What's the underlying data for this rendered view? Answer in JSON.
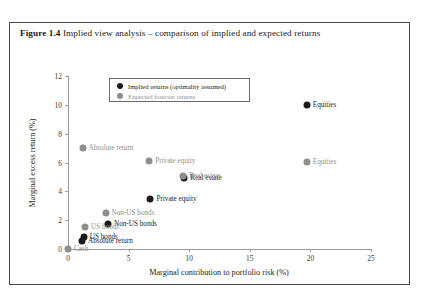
{
  "figure": {
    "number": "Figure 1.4",
    "caption": "Implied view analysis – comparison of implied and expected returns"
  },
  "legend": {
    "items": [
      {
        "label": "Implied returns (optimality assumed)",
        "series": "implied",
        "color": "#1a1a1a"
      },
      {
        "label": "Expected forecast returns",
        "series": "expected",
        "color": "#8e8e8e"
      }
    ]
  },
  "chart_data": {
    "type": "scatter",
    "title": "Implied view analysis – comparison of implied and expected returns",
    "xlabel": "Marginal contribution to portfolio risk (%)",
    "ylabel": "Marginal excess return (%)",
    "xlim": [
      0,
      25
    ],
    "ylim": [
      0,
      12
    ],
    "xticks": [
      0,
      5,
      10,
      15,
      20,
      25
    ],
    "yticks": [
      0,
      2,
      4,
      6,
      8,
      10,
      12
    ],
    "grid": false,
    "legend_position": "upper-center",
    "series": [
      {
        "name": "Implied returns (optimality assumed)",
        "color": "#1a1a1a",
        "points": [
          {
            "label": "Equities",
            "x": 19.7,
            "y": 10.0,
            "label_side": "right"
          },
          {
            "label": "Real estate",
            "x": 9.6,
            "y": 4.9,
            "label_side": "right"
          },
          {
            "label": "Private equity",
            "x": 6.8,
            "y": 3.45,
            "label_side": "right"
          },
          {
            "label": "Non-US bonds",
            "x": 3.3,
            "y": 1.75,
            "label_side": "right"
          },
          {
            "label": "US bonds",
            "x": 1.3,
            "y": 0.8,
            "label_side": "right"
          },
          {
            "label": "Absolute return",
            "x": 1.15,
            "y": 0.58,
            "label_side": "right"
          }
        ]
      },
      {
        "name": "Expected forecast returns",
        "color": "#8e8e8e",
        "points": [
          {
            "label": "Equities",
            "x": 19.7,
            "y": 6.05,
            "label_side": "right"
          },
          {
            "label": "Absolute return",
            "x": 1.2,
            "y": 7.0,
            "label_side": "right"
          },
          {
            "label": "Private equity",
            "x": 6.7,
            "y": 6.1,
            "label_side": "right"
          },
          {
            "label": "Real estate",
            "x": 9.5,
            "y": 5.05,
            "label_side": "right"
          },
          {
            "label": "Non-US bonds",
            "x": 3.1,
            "y": 2.5,
            "label_side": "right"
          },
          {
            "label": "US bonds",
            "x": 1.4,
            "y": 1.55,
            "label_side": "right"
          },
          {
            "label": "Cash",
            "x": 0.0,
            "y": 0.0,
            "label_side": "right"
          }
        ]
      }
    ]
  }
}
